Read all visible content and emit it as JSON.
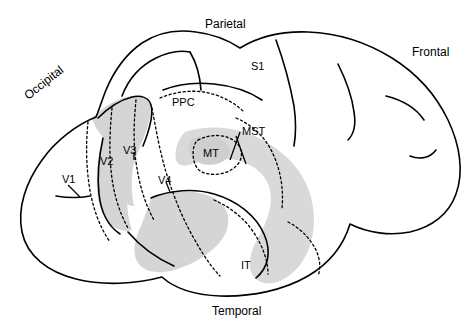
{
  "figure": {
    "type": "brain-lateral-view-diagram",
    "background": "#ffffff",
    "outline_color": "#000000",
    "shade_light": "#d9d9d9",
    "shade_mid": "#cfcfcf"
  },
  "lobe_labels": [
    {
      "id": "parietal",
      "text": "Parietal",
      "x": 205,
      "y": 18,
      "rotation": 0,
      "size": "big"
    },
    {
      "id": "frontal",
      "text": "Frontal",
      "x": 412,
      "y": 46,
      "rotation": 0,
      "size": "big"
    },
    {
      "id": "occipital",
      "text": "Occipital",
      "x": 22,
      "y": 92,
      "rotation": -38,
      "size": "big"
    },
    {
      "id": "temporal",
      "text": "Temporal",
      "x": 212,
      "y": 305,
      "rotation": 0,
      "size": "big"
    }
  ],
  "area_labels": [
    {
      "id": "s1",
      "text": "S1",
      "x": 251,
      "y": 61,
      "rotation": 0,
      "size": "small"
    },
    {
      "id": "ppc",
      "text": "PPC",
      "x": 172,
      "y": 97,
      "rotation": 0,
      "size": "small"
    },
    {
      "id": "mst",
      "text": "MST",
      "x": 242,
      "y": 126,
      "rotation": 0,
      "size": "small"
    },
    {
      "id": "mt",
      "text": "MT",
      "x": 203,
      "y": 148,
      "rotation": 0,
      "size": "small"
    },
    {
      "id": "v3",
      "text": "V3",
      "x": 123,
      "y": 145,
      "rotation": 0,
      "size": "small"
    },
    {
      "id": "v2",
      "text": "V2",
      "x": 100,
      "y": 156,
      "rotation": 0,
      "size": "small"
    },
    {
      "id": "v1",
      "text": "V1",
      "x": 62,
      "y": 174,
      "rotation": 0,
      "size": "small"
    },
    {
      "id": "v4",
      "text": "V4",
      "x": 158,
      "y": 175,
      "rotation": 0,
      "size": "small"
    },
    {
      "id": "it",
      "text": "IT",
      "x": 241,
      "y": 260,
      "rotation": 0,
      "size": "small"
    }
  ]
}
